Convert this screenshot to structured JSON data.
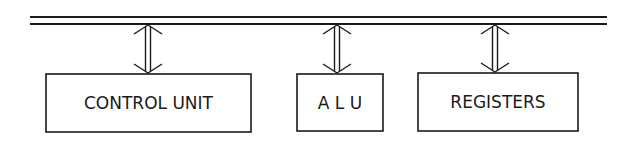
{
  "diagram": {
    "type": "block-diagram",
    "colors": {
      "stroke": "#1a1a1a",
      "background": "#ffffff"
    },
    "bus": {
      "label": "",
      "x1": 30,
      "x2": 607,
      "y_top": 17,
      "y_bottom": 24
    },
    "blocks": [
      {
        "id": "control-unit",
        "label": "CONTROL UNIT",
        "x": 46,
        "y": 74,
        "w": 205,
        "h": 58,
        "arrow_x": 148
      },
      {
        "id": "alu",
        "label": "A L U",
        "x": 297,
        "y": 74,
        "w": 86,
        "h": 57,
        "arrow_x": 337
      },
      {
        "id": "registers",
        "label": "REGISTERS",
        "x": 418,
        "y": 73,
        "w": 160,
        "h": 58,
        "arrow_x": 495
      }
    ],
    "connections": [
      {
        "from": "bus",
        "to": "control-unit",
        "style": "double-headed hollow arrow"
      },
      {
        "from": "bus",
        "to": "alu",
        "style": "double-headed hollow arrow"
      },
      {
        "from": "bus",
        "to": "registers",
        "style": "double-headed hollow arrow"
      }
    ]
  }
}
